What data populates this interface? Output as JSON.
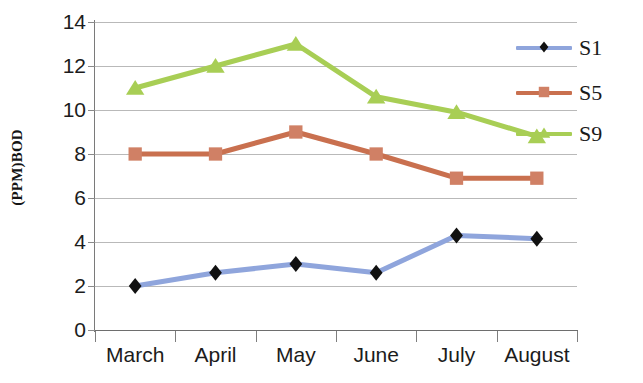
{
  "chart_data": {
    "type": "line",
    "title": "",
    "xlabel": "",
    "ylabel": "(PPM)BOD",
    "categories": [
      "March",
      "April",
      "May",
      "June",
      "July",
      "August"
    ],
    "ylim": [
      0,
      14
    ],
    "ytick_step": 2,
    "yticks": [
      0,
      2,
      4,
      6,
      8,
      10,
      12,
      14
    ],
    "ytick_labels": [
      "0",
      "2",
      "4",
      "6",
      "8",
      "10",
      "12",
      "14"
    ],
    "grid": true,
    "grid_axis": "y",
    "legend_position": "right",
    "series": [
      {
        "name": "S1",
        "color": "#8FA5DC",
        "marker": "diamond",
        "marker_color": "#111111",
        "values": [
          2.0,
          2.6,
          3.0,
          2.6,
          4.3,
          4.15
        ]
      },
      {
        "name": "S5",
        "color": "#C9704F",
        "marker": "square",
        "marker_color": "#D08065",
        "values": [
          8.0,
          8.0,
          9.0,
          8.0,
          6.9,
          6.9
        ]
      },
      {
        "name": "S9",
        "color": "#A8CE55",
        "marker": "triangle",
        "marker_color": "#A8CE55",
        "values": [
          11.0,
          12.0,
          13.0,
          10.6,
          9.9,
          8.8
        ]
      }
    ]
  },
  "axes": {
    "y_title": "(PPM)BOD",
    "axis_color": "#7a7a7a",
    "gridline_color": "#b9b9b9"
  },
  "legend": {
    "entries": [
      {
        "label": "S1",
        "color": "#8FA5DC",
        "marker": "diamond"
      },
      {
        "label": "S5",
        "color": "#C9704F",
        "marker": "square"
      },
      {
        "label": "S9",
        "color": "#A8CE55",
        "marker": "triangle"
      }
    ]
  }
}
